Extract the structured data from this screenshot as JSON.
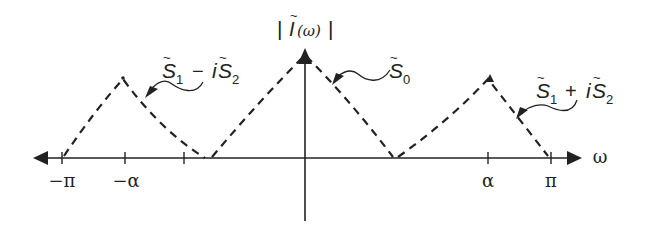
{
  "diagram": {
    "y_axis_label": "|Ĩ(ω)|",
    "x_axis_label": "ω",
    "ticks": [
      {
        "label": "−π",
        "x": 62
      },
      {
        "label": "−α",
        "x": 125
      },
      {
        "label": "",
        "x": 184
      },
      {
        "label": "",
        "x": 305
      },
      {
        "label": "α",
        "x": 488
      },
      {
        "label": "π",
        "x": 551
      }
    ],
    "peaks": [
      {
        "name": "S1 - iS2",
        "label_main": "S̃₁ − iS̃₂",
        "x": 123,
        "y": 77
      },
      {
        "name": "S0",
        "label_main": "S̃₀",
        "x": 305,
        "y": 52
      },
      {
        "name": "S1 + iS2",
        "label_main": "S̃₁ + iS̃₂",
        "x": 490,
        "y": 77
      }
    ],
    "labels": {
      "left_peak": {
        "S": "S",
        "sub1": "1",
        "op": "−",
        "i": "i",
        "S2": "S",
        "sub2": "2"
      },
      "center_peak": {
        "S": "S",
        "sub": "0"
      },
      "right_peak": {
        "S": "S",
        "sub1": "1",
        "op": "+",
        "i": "i",
        "S2": "S",
        "sub2": "2"
      },
      "y_axis": {
        "bar_l": "|",
        "I": "I",
        "arg": "(ω)",
        "bar_r": "|"
      },
      "x_axis": "ω",
      "tilde": "~"
    },
    "colors": {
      "ink": "#222222",
      "background": "#ffffff"
    }
  }
}
